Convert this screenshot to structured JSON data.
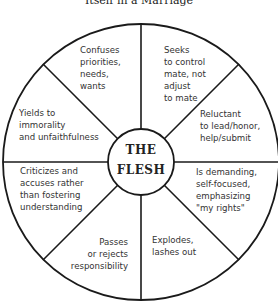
{
  "title": "Itself in a Marriage",
  "center": {
    "line1": "THE",
    "line2": "FLESH"
  },
  "segments": [
    {
      "id": "top-left",
      "lines": [
        "Confuses",
        "priorities,",
        "needs,",
        "wants"
      ]
    },
    {
      "id": "top-right",
      "lines": [
        "Seeks",
        "to control",
        "mate, not",
        "adjust",
        "to mate"
      ]
    },
    {
      "id": "right-upper",
      "lines": [
        "Reluctant",
        "to lead/honor,",
        "help/submit"
      ]
    },
    {
      "id": "right-lower",
      "lines": [
        "Is demanding,",
        "self-focused,",
        "emphasizing",
        "\"my rights\""
      ]
    },
    {
      "id": "bottom-right",
      "lines": [
        "Explodes,",
        "lashes out"
      ]
    },
    {
      "id": "bottom-left",
      "lines": [
        "Passes",
        "or rejects",
        "responsibility"
      ]
    },
    {
      "id": "left-lower",
      "lines": [
        "Criticizes and",
        "accuses rather",
        "than fostering",
        "understanding"
      ]
    },
    {
      "id": "left-upper",
      "lines": [
        "Yields to",
        "immorality",
        "and unfaithfulness"
      ]
    }
  ],
  "colors": {
    "line": "#1a1a1a",
    "text": "#333333",
    "background": "#ffffff"
  }
}
